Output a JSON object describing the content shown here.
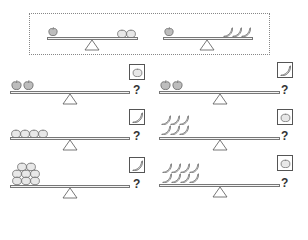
{
  "reference": {
    "left_scale": {
      "left": {
        "fruit": "apple",
        "count": 1
      },
      "right": {
        "fruit": "orange",
        "count": 2
      }
    },
    "right_scale": {
      "left": {
        "fruit": "apple",
        "count": 1
      },
      "right": {
        "fruit": "banana",
        "count": 3
      }
    }
  },
  "questions": [
    {
      "id": 1,
      "left": {
        "fruit": "apple",
        "count": 2
      },
      "answer_icon": "orange",
      "label": "?"
    },
    {
      "id": 2,
      "left": {
        "fruit": "apple",
        "count": 2
      },
      "answer_icon": "banana",
      "label": "?"
    },
    {
      "id": 3,
      "left": {
        "fruit": "orange",
        "count": 4
      },
      "answer_icon": "banana",
      "label": "?"
    },
    {
      "id": 4,
      "left": {
        "fruit": "banana",
        "count": 6
      },
      "answer_icon": "orange",
      "label": "?"
    },
    {
      "id": 5,
      "left": {
        "fruit": "orange",
        "count": 8
      },
      "answer_icon": "banana",
      "label": "?"
    },
    {
      "id": 6,
      "left": {
        "fruit": "banana",
        "count": 8
      },
      "answer_icon": "orange",
      "label": "?"
    }
  ],
  "colors": {
    "outline": "#555555",
    "fruit_fill": "#cfcfcf",
    "beam": "#777777"
  }
}
